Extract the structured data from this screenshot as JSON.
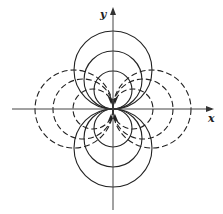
{
  "figure": {
    "axes": {
      "x_label": "x",
      "y_label": "y",
      "origin": [
        113,
        109
      ],
      "x_range_px": [
        12,
        214
      ],
      "y_range_px": [
        7,
        210
      ]
    },
    "solid_circles": {
      "style": "solid",
      "description": "Circles tangent to x-axis at origin, centered on y-axis (above and below)",
      "radii_px": [
        39,
        29,
        19
      ]
    },
    "dashed_circles": {
      "style": "dashed",
      "description": "Circles tangent to y-axis at origin, centered on x-axis (left and right)",
      "radii_px": [
        39,
        30,
        20
      ]
    },
    "colors": {
      "stroke": "#222222",
      "background": "#ffffff"
    }
  }
}
